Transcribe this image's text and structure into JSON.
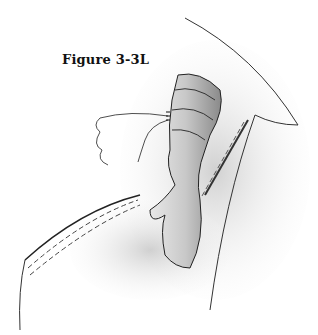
{
  "figure": {
    "caption": "Figure 3-3L"
  }
}
